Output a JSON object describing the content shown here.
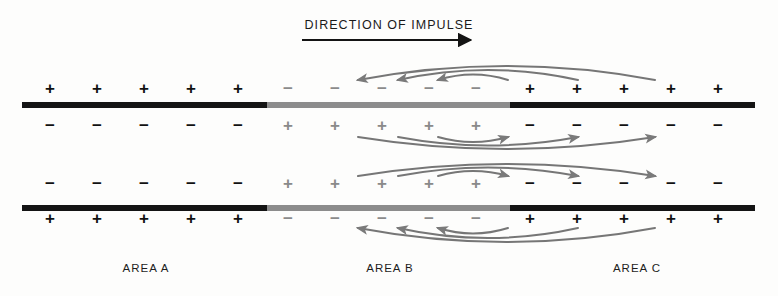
{
  "diagram": {
    "title": "DIRECTION OF IMPULSE",
    "type": "nerve-impulse-propagation",
    "colors": {
      "dark": "#141414",
      "gray": "#8c8c8c",
      "arrow": "#767676",
      "text": "#1a1a1a",
      "background": "#fdfdfc"
    }
  },
  "direction_arrow": {
    "label": "direction-of-impulse-arrow",
    "x_start": 302,
    "x_end": 480,
    "y": 40,
    "points": "right"
  },
  "areas": [
    {
      "id": "A",
      "label": "AREA A",
      "center_x": 146,
      "state": "resting-polarized",
      "bar_color": "#141414"
    },
    {
      "id": "B",
      "label": "AREA B",
      "center_x": 390,
      "state": "depolarized-active",
      "bar_color": "#8c8c8c"
    },
    {
      "id": "C",
      "label": "AREA C",
      "center_x": 637,
      "state": "resting-polarized",
      "bar_color": "#141414"
    }
  ],
  "membranes": [
    {
      "name": "upper-membrane",
      "y": 102,
      "segments": [
        {
          "area": "A",
          "x": 22,
          "width": 245,
          "color": "dark"
        },
        {
          "area": "B",
          "x": 267,
          "width": 243,
          "color": "gray"
        },
        {
          "area": "C",
          "x": 510,
          "width": 245,
          "color": "dark"
        }
      ]
    },
    {
      "name": "lower-membrane",
      "y": 205,
      "segments": [
        {
          "area": "A",
          "x": 22,
          "width": 245,
          "color": "dark"
        },
        {
          "area": "B",
          "x": 267,
          "width": 243,
          "color": "gray"
        },
        {
          "area": "C",
          "x": 510,
          "width": 245,
          "color": "dark"
        }
      ]
    }
  ],
  "charge_columns_x": [
    50,
    97,
    144,
    191,
    238,
    288,
    335,
    382,
    429,
    476,
    530,
    577,
    624,
    671,
    718
  ],
  "charge_rows": [
    {
      "name": "row-outer-top",
      "y": 88,
      "position": "above-upper-membrane",
      "signs": [
        "+",
        "+",
        "+",
        "+",
        "+",
        "−",
        "−",
        "−",
        "−",
        "−",
        "+",
        "+",
        "+",
        "+",
        "+"
      ],
      "shades": [
        "dark",
        "dark",
        "dark",
        "dark",
        "dark",
        "gray",
        "gray",
        "gray",
        "gray",
        "gray",
        "dark",
        "dark",
        "dark",
        "dark",
        "dark"
      ]
    },
    {
      "name": "row-inner-top",
      "y": 125,
      "position": "below-upper-membrane",
      "signs": [
        "−",
        "−",
        "−",
        "−",
        "−",
        "+",
        "+",
        "+",
        "+",
        "+",
        "−",
        "−",
        "−",
        "−",
        "−"
      ],
      "shades": [
        "dark",
        "dark",
        "dark",
        "dark",
        "dark",
        "gray",
        "gray",
        "gray",
        "gray",
        "gray",
        "dark",
        "dark",
        "dark",
        "dark",
        "dark"
      ]
    },
    {
      "name": "row-inner-bottom",
      "y": 183,
      "position": "above-lower-membrane",
      "signs": [
        "−",
        "−",
        "−",
        "−",
        "−",
        "+",
        "+",
        "+",
        "+",
        "+",
        "−",
        "−",
        "−",
        "−",
        "−"
      ],
      "shades": [
        "dark",
        "dark",
        "dark",
        "dark",
        "dark",
        "gray",
        "gray",
        "gray",
        "gray",
        "gray",
        "dark",
        "dark",
        "dark",
        "dark",
        "dark"
      ]
    },
    {
      "name": "row-outer-bottom",
      "y": 218,
      "position": "below-lower-membrane",
      "signs": [
        "+",
        "+",
        "+",
        "+",
        "+",
        "−",
        "−",
        "−",
        "−",
        "−",
        "+",
        "+",
        "+",
        "+",
        "+"
      ],
      "shades": [
        "dark",
        "dark",
        "dark",
        "dark",
        "dark",
        "gray",
        "gray",
        "gray",
        "gray",
        "gray",
        "dark",
        "dark",
        "dark",
        "dark",
        "dark"
      ]
    }
  ],
  "current_arcs": [
    {
      "name": "outer-top-arc-large",
      "group": "above-upper-membrane",
      "direction": "leftward",
      "x_from": 655,
      "x_to": 358,
      "bulge": -28
    },
    {
      "name": "outer-top-arc-medium",
      "group": "above-upper-membrane",
      "direction": "leftward",
      "x_from": 578,
      "x_to": 398,
      "bulge": -20
    },
    {
      "name": "outer-top-arc-small",
      "group": "above-upper-membrane",
      "direction": "leftward",
      "x_from": 508,
      "x_to": 438,
      "bulge": -11
    },
    {
      "name": "inner-top-arc-large",
      "group": "below-upper-membrane",
      "direction": "rightward",
      "x_from": 358,
      "x_to": 655,
      "bulge": 24
    },
    {
      "name": "inner-top-arc-medium",
      "group": "below-upper-membrane",
      "direction": "rightward",
      "x_from": 398,
      "x_to": 578,
      "bulge": 17
    },
    {
      "name": "inner-top-arc-small",
      "group": "below-upper-membrane",
      "direction": "rightward",
      "x_from": 438,
      "x_to": 508,
      "bulge": 10
    },
    {
      "name": "inner-bottom-arc-large",
      "group": "above-lower-membrane",
      "direction": "rightward",
      "x_from": 358,
      "x_to": 655,
      "bulge": -24
    },
    {
      "name": "inner-bottom-arc-medium",
      "group": "above-lower-membrane",
      "direction": "rightward",
      "x_from": 398,
      "x_to": 578,
      "bulge": -17
    },
    {
      "name": "inner-bottom-arc-small",
      "group": "above-lower-membrane",
      "direction": "rightward",
      "x_from": 438,
      "x_to": 508,
      "bulge": -10
    },
    {
      "name": "outer-bottom-arc-large",
      "group": "below-lower-membrane",
      "direction": "leftward",
      "x_from": 655,
      "x_to": 358,
      "bulge": 28
    },
    {
      "name": "outer-bottom-arc-medium",
      "group": "below-lower-membrane",
      "direction": "leftward",
      "x_from": 578,
      "x_to": 398,
      "bulge": 20
    },
    {
      "name": "outer-bottom-arc-small",
      "group": "below-lower-membrane",
      "direction": "leftward",
      "x_from": 508,
      "x_to": 438,
      "bulge": 11
    }
  ]
}
